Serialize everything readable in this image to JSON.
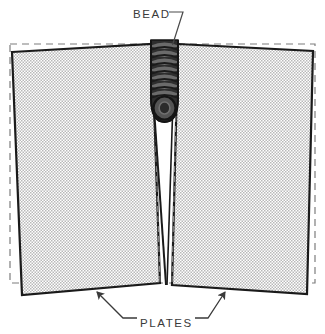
{
  "diagram": {
    "type": "technical-illustration",
    "background_color": "#ffffff",
    "labels": {
      "bead": "BEAD",
      "plates": "PLATES"
    },
    "colors": {
      "plate_fill": "#d9d9d9",
      "plate_outline": "#1a1a1a",
      "bead_dark": "#2b2b2b",
      "bead_mid": "#545454",
      "bead_light": "#8a8a8a",
      "gap_fill": "#ffffff",
      "dashed_guide": "#7d7d7d",
      "leader_line": "#4a4a4a",
      "text": "#3a3a3a"
    },
    "elements": {
      "dashed_reference_rectangle": {
        "name": "dashed-outline",
        "x": 10,
        "y": 44,
        "width": 305,
        "height": 239,
        "dash": "7 5"
      },
      "left_plate": {
        "name": "left-plate",
        "points": "12,52 152,44 160,283 22,295",
        "fill": "#d9d9d9"
      },
      "right_plate": {
        "name": "right-plate",
        "points": "177,44 313,51 307,294 172,285",
        "fill": "#d9d9d9"
      },
      "weld_gap": {
        "name": "weld-gap",
        "description": "unfilled V groove tapering to a point",
        "top_y": 118,
        "bottom_y": 285,
        "fill": "#ffffff"
      },
      "weld_bead": {
        "name": "weld-bead",
        "description": "stacked ripple weld bead",
        "x_range": [
          151,
          178
        ],
        "y_range": [
          40,
          122
        ],
        "ripple_count": 9
      },
      "inner_dashed_guides": [
        {
          "name": "left-inner-guide",
          "x1": 152,
          "y1": 44,
          "x2": 160,
          "y2": 283
        },
        {
          "name": "right-inner-guide",
          "x1": 178,
          "y1": 44,
          "x2": 172,
          "y2": 283
        }
      ],
      "bead_leader": {
        "name": "bead-leader-line",
        "path": "M 170 12 L 183 12 L 172 45"
      },
      "plate_leader_left": {
        "name": "left-plate-leader-line",
        "path": "M 96 291 L 123 318 L 137 318",
        "arrow_tip": [
          96,
          291
        ]
      },
      "plate_leader_right": {
        "name": "right-plate-leader-line",
        "path": "M 226 291 L 208 318 L 195 318",
        "arrow_tip": [
          226,
          291
        ]
      }
    },
    "text_positions": {
      "bead": {
        "x": 133,
        "y": 18
      },
      "plates": {
        "x": 140,
        "y": 327
      }
    }
  }
}
